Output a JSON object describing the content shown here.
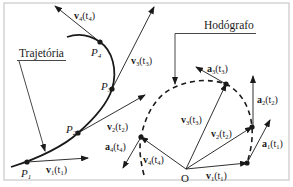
{
  "diagram": {
    "colors": {
      "stroke": "#1a1a1a",
      "frame": "#c8c8c8",
      "background": "#ffffff"
    },
    "trajectory": {
      "label": "Trajetória",
      "points": [
        {
          "name": "P",
          "sub": "1",
          "x": 27,
          "y": 162
        },
        {
          "name": "P",
          "sub": "2",
          "x": 78,
          "y": 133
        },
        {
          "name": "P",
          "sub": "3",
          "x": 112,
          "y": 89
        },
        {
          "name": "P",
          "sub": "4",
          "x": 100,
          "y": 42
        }
      ],
      "velocities": [
        {
          "sym": "v",
          "sub": "1",
          "t": "t",
          "tsub": "1",
          "text": "v1(t1)"
        },
        {
          "sym": "v",
          "sub": "2",
          "t": "t",
          "tsub": "2",
          "text": "v2(t2)"
        },
        {
          "sym": "v",
          "sub": "3",
          "t": "t",
          "tsub": "3",
          "text": "v3(t3)"
        },
        {
          "sym": "v",
          "sub": "4",
          "t": "t",
          "tsub": "4",
          "text": "v4(t4)"
        }
      ]
    },
    "hodograph": {
      "label": "Hodógrafo",
      "origin_label": "O",
      "velocities": [
        {
          "text": "v1(t1)",
          "sub": "1",
          "tsub": "1"
        },
        {
          "text": "v2(t2)",
          "sub": "2",
          "tsub": "2"
        },
        {
          "text": "v3(t3)",
          "sub": "3",
          "tsub": "3"
        },
        {
          "text": "v4(t4)",
          "sub": "4",
          "tsub": "4"
        }
      ],
      "accelerations": [
        {
          "text": "a1(t1)",
          "sub": "1",
          "tsub": "1"
        },
        {
          "text": "a2(t2)",
          "sub": "2",
          "tsub": "2"
        },
        {
          "text": "a3(t3)",
          "sub": "3",
          "tsub": "3"
        },
        {
          "text": "a4(t4)",
          "sub": "4",
          "tsub": "4"
        }
      ]
    }
  }
}
